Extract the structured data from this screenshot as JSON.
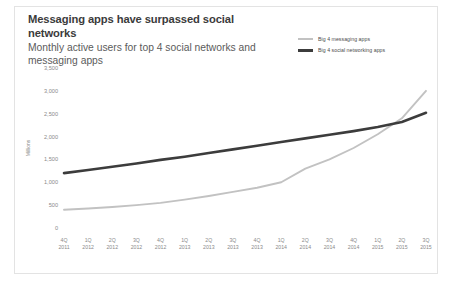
{
  "chart_data": {
    "type": "line",
    "title": "Messaging apps have surpassed social networks",
    "subtitle": "Monthly active users for top 4 social networks and messaging apps",
    "xlabel": "",
    "ylabel": "Millions",
    "ylim": [
      0,
      3500
    ],
    "ytick_labels": [
      "0",
      "500",
      "1,000",
      "1,500",
      "2,000",
      "2,500",
      "3,000",
      "3,500"
    ],
    "ytick_values": [
      0,
      500,
      1000,
      1500,
      2000,
      2500,
      3000,
      3500
    ],
    "grid": false,
    "legend_position": "top-right",
    "categories": [
      "4Q\n2011",
      "1Q\n2012",
      "2Q\n2012",
      "3Q\n2012",
      "4Q\n2012",
      "1Q\n2013",
      "2Q\n2013",
      "3Q\n2013",
      "4Q\n2013",
      "1Q\n2014",
      "2Q\n2014",
      "3Q\n2014",
      "4Q\n2014",
      "1Q\n2015",
      "2Q\n2015",
      "3Q\n2015"
    ],
    "categories_top": [
      "4Q",
      "1Q",
      "2Q",
      "3Q",
      "4Q",
      "1Q",
      "2Q",
      "3Q",
      "4Q",
      "1Q",
      "2Q",
      "3Q",
      "4Q",
      "1Q",
      "2Q",
      "3Q"
    ],
    "categories_bottom": [
      "2011",
      "2012",
      "2012",
      "2012",
      "2012",
      "2013",
      "2013",
      "2013",
      "2013",
      "2014",
      "2014",
      "2014",
      "2014",
      "2015",
      "2015",
      "2015"
    ],
    "series": [
      {
        "name": "Big 4 messaging apps",
        "color": "#c2c2c2",
        "values": [
          400,
          425,
          460,
          500,
          550,
          620,
          700,
          790,
          880,
          1000,
          1300,
          1500,
          1750,
          2050,
          2400,
          3000
        ]
      },
      {
        "name": "Big 4 social networking apps",
        "color": "#3c3c3c",
        "values": [
          1200,
          1270,
          1340,
          1410,
          1490,
          1560,
          1640,
          1720,
          1800,
          1880,
          1960,
          2040,
          2120,
          2210,
          2320,
          2520
        ]
      }
    ]
  },
  "legend": {
    "items": [
      {
        "label": "Big 4 messaging apps",
        "style": "light"
      },
      {
        "label": "Big 4 social networking apps",
        "style": "dark"
      }
    ]
  }
}
